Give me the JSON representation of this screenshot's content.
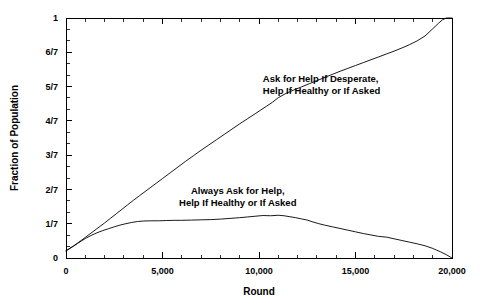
{
  "chart_data": {
    "type": "line",
    "title": "",
    "xlabel": "Round",
    "ylabel": "Fraction of Population",
    "xlim": [
      0,
      20000
    ],
    "ylim": [
      0,
      1
    ],
    "grid": false,
    "legend_position": "inline-annotations",
    "x_ticks": [
      {
        "value": 0,
        "label": "0"
      },
      {
        "value": 5000,
        "label": "5,000"
      },
      {
        "value": 10000,
        "label": "10,000"
      },
      {
        "value": 15000,
        "label": "15,000"
      },
      {
        "value": 20000,
        "label": "20,000"
      }
    ],
    "x_minor_tick_interval": 1000,
    "y_ticks": [
      {
        "value": 0,
        "label": "0"
      },
      {
        "value": 0.142857,
        "label": "1/7"
      },
      {
        "value": 0.285714,
        "label": "2/7"
      },
      {
        "value": 0.428571,
        "label": "3/7"
      },
      {
        "value": 0.571429,
        "label": "4/7"
      },
      {
        "value": 0.714286,
        "label": "5/7"
      },
      {
        "value": 0.857143,
        "label": "6/7"
      },
      {
        "value": 1,
        "label": "1"
      }
    ],
    "y_minor_tick_count_between": 2,
    "series": [
      {
        "name": "Ask for Help If Desperate, Help If Healthy or If Asked",
        "color": "#000000",
        "annotation": {
          "lines": [
            "Ask for Help If Desperate,",
            "Help If Healthy or If Asked"
          ],
          "x": 10200,
          "y": 0.735
        },
        "x": [
          0,
          200,
          400,
          600,
          800,
          1000,
          1200,
          1400,
          1600,
          1800,
          2000,
          2300,
          2600,
          2900,
          3200,
          3500,
          3800,
          4100,
          4400,
          4700,
          5000,
          5400,
          5800,
          6200,
          6600,
          7000,
          7400,
          7800,
          8200,
          8600,
          9000,
          9400,
          9800,
          10100,
          10400,
          10700,
          11000,
          11400,
          11800,
          12200,
          12600,
          13000,
          13400,
          13800,
          14200,
          14600,
          15000,
          15400,
          15800,
          16200,
          16600,
          17000,
          17400,
          17800,
          18200,
          18600,
          19000,
          19300,
          19500,
          19700,
          20000
        ],
        "y": [
          0.03,
          0.04,
          0.051,
          0.062,
          0.074,
          0.086,
          0.098,
          0.11,
          0.122,
          0.134,
          0.146,
          0.165,
          0.184,
          0.203,
          0.222,
          0.241,
          0.259,
          0.277,
          0.295,
          0.313,
          0.331,
          0.355,
          0.379,
          0.403,
          0.426,
          0.449,
          0.471,
          0.493,
          0.515,
          0.537,
          0.559,
          0.58,
          0.601,
          0.617,
          0.633,
          0.649,
          0.668,
          0.686,
          0.7,
          0.713,
          0.726,
          0.739,
          0.752,
          0.765,
          0.778,
          0.79,
          0.802,
          0.814,
          0.826,
          0.838,
          0.85,
          0.862,
          0.875,
          0.889,
          0.905,
          0.925,
          0.955,
          0.978,
          0.992,
          1.0,
          1.0
        ]
      },
      {
        "name": "Always Ask for Help, Help If Healthy or If Asked",
        "color": "#000000",
        "annotation": {
          "lines": [
            "Always Ask for Help,",
            "Help If Healthy or If Asked"
          ],
          "x": 8900,
          "y": 0.268
        },
        "x": [
          0,
          200,
          400,
          600,
          800,
          1000,
          1300,
          1600,
          1900,
          2200,
          2500,
          2800,
          3100,
          3400,
          3700,
          4000,
          4400,
          4800,
          5200,
          5600,
          6000,
          6500,
          7000,
          7500,
          8000,
          8500,
          9000,
          9400,
          9800,
          10200,
          10600,
          11000,
          11300,
          11600,
          11900,
          12200,
          12500,
          12800,
          13100,
          13400,
          13800,
          14200,
          14600,
          15000,
          15400,
          15800,
          16200,
          16600,
          17000,
          17400,
          17800,
          18200,
          18600,
          19000,
          19400,
          19700,
          20000
        ],
        "y": [
          0.03,
          0.04,
          0.05,
          0.061,
          0.071,
          0.081,
          0.094,
          0.105,
          0.114,
          0.122,
          0.13,
          0.137,
          0.143,
          0.148,
          0.152,
          0.154,
          0.155,
          0.155,
          0.156,
          0.157,
          0.157,
          0.158,
          0.159,
          0.16,
          0.162,
          0.165,
          0.168,
          0.171,
          0.174,
          0.177,
          0.176,
          0.178,
          0.176,
          0.172,
          0.168,
          0.163,
          0.158,
          0.15,
          0.143,
          0.137,
          0.13,
          0.123,
          0.116,
          0.109,
          0.102,
          0.096,
          0.09,
          0.087,
          0.08,
          0.073,
          0.066,
          0.059,
          0.051,
          0.04,
          0.026,
          0.014,
          0.0
        ]
      }
    ]
  }
}
